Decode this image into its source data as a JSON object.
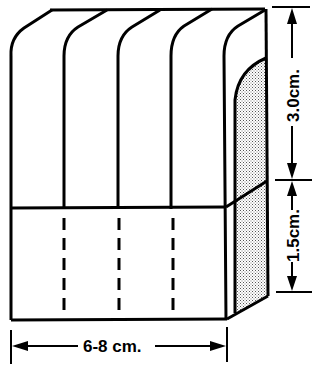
{
  "diagram": {
    "colors": {
      "line": "#000000",
      "background": "#ffffff",
      "shade": "#bdbdbd"
    },
    "dimensions": {
      "upper_height_label": "3.0cm.",
      "lower_height_label": "1.5cm.",
      "width_label": "6-8 cm."
    },
    "sections": {
      "upper_columns": 4,
      "lower_columns": 4
    }
  }
}
